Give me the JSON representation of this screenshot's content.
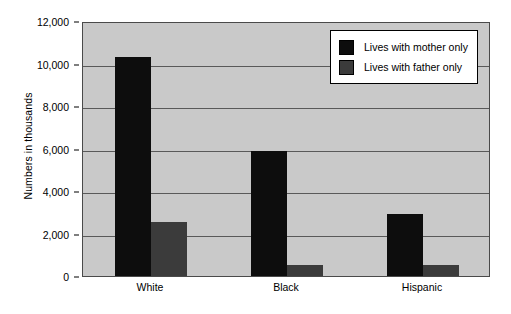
{
  "chart_data": {
    "type": "bar",
    "title": "",
    "subtitle": "",
    "xlabel": "",
    "ylabel": "Numbers in thousands",
    "categories": [
      "White",
      "Black",
      "Hispanic"
    ],
    "ylim": [
      0,
      12000
    ],
    "yticks": [
      0,
      2000,
      4000,
      6000,
      8000,
      10000,
      12000
    ],
    "ytick_labels": [
      "0",
      "2,000",
      "4,000",
      "6,000",
      "8,000",
      "10,000",
      "12,000"
    ],
    "grid": true,
    "legend_position": "top-right",
    "series": [
      {
        "name": "Lives with mother only",
        "color": "#0d0d0d",
        "values": [
          10300,
          5900,
          2900
        ]
      },
      {
        "name": "Lives with father only",
        "color": "#3b3b3b",
        "values": [
          2550,
          500,
          520
        ]
      }
    ]
  },
  "legend": {
    "entries": [
      {
        "label": "Lives with mother only",
        "swatch": "mother"
      },
      {
        "label": "Lives with father only",
        "swatch": "father"
      }
    ]
  },
  "colors": {
    "plot_background": "#c9c9c9",
    "gridline": "#595959",
    "axis": "#4a4a4a",
    "page_background": "#ffffff",
    "series_mother": "#0d0d0d",
    "series_father": "#3b3b3b"
  }
}
